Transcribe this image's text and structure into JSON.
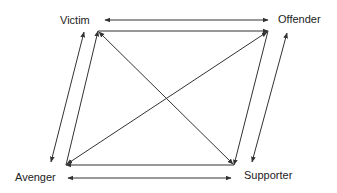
{
  "diagram": {
    "nodes": [
      {
        "id": "victim",
        "label": "Victim"
      },
      {
        "id": "offender",
        "label": "Offender"
      },
      {
        "id": "avenger",
        "label": "Avenger"
      },
      {
        "id": "supporter",
        "label": "Supporter"
      }
    ],
    "edges": [
      {
        "from": "victim",
        "to": "offender",
        "type": "bidirectional",
        "style": "outer arrow"
      },
      {
        "from": "avenger",
        "to": "supporter",
        "type": "bidirectional",
        "style": "outer arrow"
      },
      {
        "from": "victim",
        "to": "avenger",
        "type": "bidirectional",
        "style": "outer arrow"
      },
      {
        "from": "offender",
        "to": "supporter",
        "type": "bidirectional",
        "style": "outer arrow"
      },
      {
        "from": "victim",
        "to": "offender",
        "type": "line",
        "style": "parallelogram side"
      },
      {
        "from": "offender",
        "to": "supporter",
        "type": "line",
        "style": "parallelogram side"
      },
      {
        "from": "supporter",
        "to": "avenger",
        "type": "line",
        "style": "parallelogram side"
      },
      {
        "from": "avenger",
        "to": "victim",
        "type": "line",
        "style": "parallelogram side"
      },
      {
        "from": "victim",
        "to": "supporter",
        "type": "bidirectional",
        "style": "diagonal"
      },
      {
        "from": "avenger",
        "to": "offender",
        "type": "bidirectional",
        "style": "diagonal"
      }
    ],
    "colors": {
      "line": "#333333",
      "text": "#222222",
      "background": "#ffffff"
    }
  }
}
